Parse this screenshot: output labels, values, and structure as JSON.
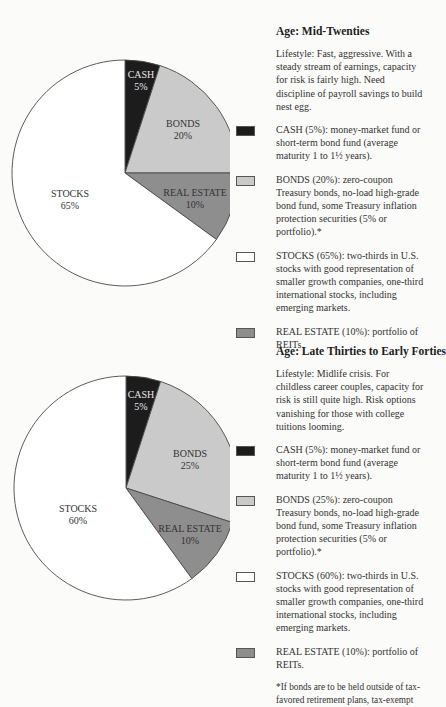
{
  "colors": {
    "cash": "#1c1c1c",
    "bonds": "#cacaca",
    "stocks": "#ffffff",
    "real_estate": "#8e8e8e",
    "outline": "#555555"
  },
  "sections": [
    {
      "title": "Age: Mid-Twenties",
      "lifestyle": "Lifestyle: Fast, aggressive. With a steady stream of earnings, capacity for risk is fairly high. Need discipline of payroll savings to build nest egg.",
      "legend": [
        {
          "key": "cash",
          "text": "CASH (5%): money-market fund or short-term bond fund (average maturity 1 to 1½ years)."
        },
        {
          "key": "bonds",
          "text": "BONDS (20%): zero-coupon Treasury bonds, no-load high-grade bond fund, some Treasury inflation protection securities (5% or portfolio).*"
        },
        {
          "key": "stocks",
          "text": "STOCKS (65%): two-thirds in U.S. stocks with good representation of smaller growth companies, one-third international stocks, including emerging markets."
        },
        {
          "key": "real_estate",
          "text": "REAL ESTATE (10%): portfolio of REITs."
        }
      ],
      "pie_labels": {
        "cash": [
          "CASH",
          "5%"
        ],
        "bonds": [
          "BONDS",
          "20%"
        ],
        "real_estate": [
          "REAL ESTATE",
          "10%"
        ],
        "stocks": [
          "STOCKS",
          "65%"
        ]
      }
    },
    {
      "title": "Age: Late Thirties to Early Forties",
      "lifestyle": "Lifestyle: Midlife crisis. For childless career couples, capacity for risk is still quite high. Risk options vanishing for those with college tuitions looming.",
      "legend": [
        {
          "key": "cash",
          "text": "CASH (5%): money-market fund or short-term bond fund (average maturity 1 to 1½ years)."
        },
        {
          "key": "bonds",
          "text": "BONDS (25%): zero-coupon Treasury bonds, no-load high-grade bond fund, some Treasury inflation protection securities (5% or portfolio).*"
        },
        {
          "key": "stocks",
          "text": "STOCKS (60%): two-thirds in U.S. stocks with good representation of smaller growth companies, one-third international stocks, including emerging markets."
        },
        {
          "key": "real_estate",
          "text": "REAL ESTATE (10%): portfolio of REITs."
        }
      ],
      "pie_labels": {
        "cash": [
          "CASH",
          "5%"
        ],
        "bonds": [
          "BONDS",
          "25%"
        ],
        "real_estate": [
          "REAL ESTATE",
          "10%"
        ],
        "stocks": [
          "STOCKS",
          "60%"
        ]
      },
      "footnote": "*If bonds are to be held outside of tax-favored retirement plans, tax-exempt"
    }
  ],
  "chart_data": [
    {
      "type": "pie",
      "title": "Age: Mid-Twenties",
      "categories": [
        "CASH",
        "BONDS",
        "REAL ESTATE",
        "STOCKS"
      ],
      "values": [
        5,
        20,
        10,
        65
      ],
      "colors": [
        "#1c1c1c",
        "#cacaca",
        "#8e8e8e",
        "#ffffff"
      ],
      "start_angle": "12 o'clock, clockwise",
      "legend_position": "right"
    },
    {
      "type": "pie",
      "title": "Age: Late Thirties to Early Forties",
      "categories": [
        "CASH",
        "BONDS",
        "REAL ESTATE",
        "STOCKS"
      ],
      "values": [
        5,
        25,
        10,
        60
      ],
      "colors": [
        "#1c1c1c",
        "#cacaca",
        "#8e8e8e",
        "#ffffff"
      ],
      "start_angle": "12 o'clock, clockwise",
      "legend_position": "right"
    }
  ]
}
